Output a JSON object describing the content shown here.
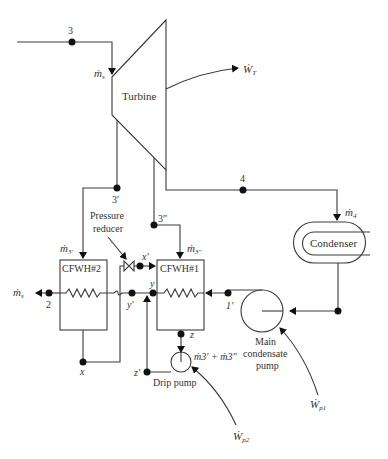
{
  "diagram": {
    "components": {
      "turbine": "Turbine",
      "condenser": "Condenser",
      "cfwh2": "CFWH#2",
      "cfwh1": "CFWH#1",
      "main_pump": [
        "Main",
        "condensate",
        "pump"
      ],
      "drip_pump": "Drip pump",
      "pressure_reducer": [
        "Pressure",
        "reducer"
      ]
    },
    "states": {
      "s3": "3",
      "s3p": "3′",
      "s3pp": "3″",
      "s4": "4",
      "s2": "2",
      "s1p": "1′",
      "x": "x",
      "xp": "x′",
      "y": "y",
      "yp": "y′",
      "z": "z",
      "zp": "z′"
    },
    "flows": {
      "ms_in": "ṁ",
      "ms_in_sub": "s",
      "ms_out": "ṁ",
      "ms_out_sub": "s",
      "m4": "ṁ",
      "m4_sub": "4",
      "m3p": "ṁ",
      "m3p_sub": "3′",
      "m3pp": "ṁ",
      "m3pp_sub": "3″",
      "drip_sum": "ṁ3′ + ṁ3″"
    },
    "work": {
      "turbine": "Ẇ",
      "turbine_sub": "T",
      "pump1": "Ẇ",
      "pump1_sub": "p1",
      "pump2": "Ẇ",
      "pump2_sub": "p2"
    }
  }
}
